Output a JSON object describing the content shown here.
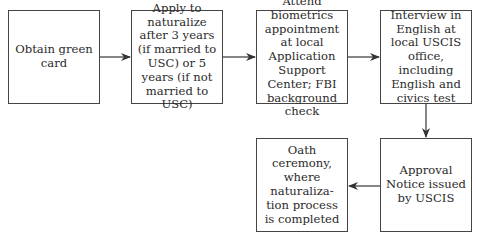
{
  "diagram": {
    "type": "flowchart",
    "title_fragment": "",
    "steps": [
      {
        "id": "step-1",
        "label": "Obtain green card"
      },
      {
        "id": "step-2",
        "label": "Apply to naturalize after 3 years (if married to USC) or 5 years (if not married to USC)"
      },
      {
        "id": "step-3",
        "label": "Attend biometrics appointment at local Application Support Center; FBI background check"
      },
      {
        "id": "step-4",
        "label": "Interview in English at local USCIS office, including English and civics test"
      },
      {
        "id": "step-5",
        "label": "Approval Notice issued by USCIS"
      },
      {
        "id": "step-6",
        "label": "Oath ceremony, where naturaliza-tion process is completed"
      }
    ],
    "edges": [
      {
        "from": "step-1",
        "to": "step-2"
      },
      {
        "from": "step-2",
        "to": "step-3"
      },
      {
        "from": "step-3",
        "to": "step-4"
      },
      {
        "from": "step-4",
        "to": "step-5"
      },
      {
        "from": "step-5",
        "to": "step-6"
      }
    ],
    "colors": {
      "stroke": "#444444",
      "text": "#2a2a2a",
      "background": "#ffffff"
    }
  }
}
